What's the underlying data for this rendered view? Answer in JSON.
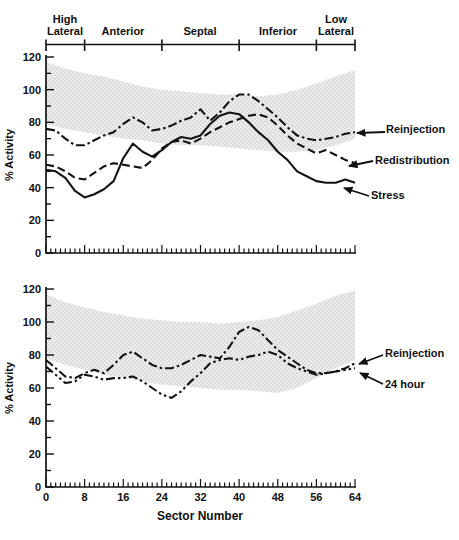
{
  "region_axis": {
    "regions": [
      {
        "label": "High Lateral",
        "from_sector": 0,
        "to_sector": 8
      },
      {
        "label": "Anterior",
        "from_sector": 8,
        "to_sector": 24
      },
      {
        "label": "Septal",
        "from_sector": 24,
        "to_sector": 40
      },
      {
        "label": "Inferior",
        "from_sector": 40,
        "to_sector": 56
      },
      {
        "label": "Low Lateral",
        "from_sector": 56,
        "to_sector": 64
      }
    ],
    "boundaries_sectors": [
      0,
      8,
      24,
      40,
      56,
      64
    ]
  },
  "chart_data": [
    {
      "type": "line",
      "title": "",
      "xlabel": "Sector Number",
      "ylabel": "% Activity",
      "xlim": [
        0,
        64
      ],
      "ylim": [
        0,
        120
      ],
      "x_ticks": [
        0,
        8,
        16,
        24,
        32,
        40,
        48,
        56,
        64
      ],
      "y_ticks": [
        0,
        20,
        40,
        60,
        80,
        100,
        120
      ],
      "x_tick_labels_visible": false,
      "grid": false,
      "legend_position": "right-arrow-annotations",
      "x": [
        0,
        2,
        4,
        6,
        8,
        10,
        12,
        14,
        16,
        18,
        20,
        22,
        24,
        26,
        28,
        30,
        32,
        34,
        36,
        38,
        40,
        42,
        44,
        46,
        48,
        50,
        52,
        54,
        56,
        58,
        60,
        62,
        64
      ],
      "series": [
        {
          "name": "Reinjection",
          "style": "dash-dot",
          "values": [
            76,
            75,
            70,
            66,
            66,
            69,
            72,
            74,
            79,
            83,
            80,
            75,
            76,
            78,
            81,
            83,
            88,
            81,
            86,
            93,
            97,
            97,
            93,
            88,
            83,
            77,
            72,
            70,
            69,
            70,
            71,
            73,
            74
          ]
        },
        {
          "name": "Redistribution",
          "style": "dashed",
          "values": [
            54,
            53,
            50,
            46,
            45,
            49,
            53,
            55,
            54,
            53,
            52,
            57,
            64,
            68,
            69,
            67,
            70,
            74,
            77,
            80,
            82,
            84,
            85,
            83,
            78,
            72,
            67,
            64,
            61,
            63,
            60,
            57,
            55
          ]
        },
        {
          "name": "Stress",
          "style": "solid",
          "values": [
            51,
            50,
            46,
            38,
            34,
            36,
            39,
            44,
            58,
            67,
            62,
            59,
            63,
            68,
            71,
            70,
            72,
            79,
            84,
            86,
            85,
            80,
            74,
            69,
            62,
            57,
            50,
            47,
            44,
            43,
            43,
            45,
            43
          ]
        }
      ],
      "normal_band": {
        "description": "stippled gray normal range band",
        "x": [
          0,
          4,
          8,
          12,
          16,
          20,
          24,
          28,
          32,
          36,
          40,
          44,
          48,
          52,
          56,
          60,
          64
        ],
        "upper": [
          117,
          113,
          110,
          108,
          105,
          102,
          100,
          99,
          98,
          97,
          97,
          96,
          97,
          100,
          104,
          108,
          112
        ],
        "lower": [
          79,
          76,
          74,
          72,
          70,
          69,
          67,
          66,
          66,
          65,
          64,
          63,
          62,
          62,
          63,
          66,
          70
        ]
      },
      "annotations": [
        {
          "label": "Reinjection"
        },
        {
          "label": "Redistribution"
        },
        {
          "label": "Stress"
        }
      ]
    },
    {
      "type": "line",
      "title": "",
      "xlabel": "Sector Number",
      "ylabel": "% Activity",
      "xlim": [
        0,
        64
      ],
      "ylim": [
        0,
        120
      ],
      "x_ticks": [
        0,
        8,
        16,
        24,
        32,
        40,
        48,
        56,
        64
      ],
      "y_ticks": [
        0,
        20,
        40,
        60,
        80,
        100,
        120
      ],
      "x_tick_labels_visible": true,
      "grid": false,
      "legend_position": "right-arrow-annotations",
      "x": [
        0,
        2,
        4,
        6,
        8,
        10,
        12,
        14,
        16,
        18,
        20,
        22,
        24,
        26,
        28,
        30,
        32,
        34,
        36,
        38,
        40,
        42,
        44,
        46,
        48,
        50,
        52,
        54,
        56,
        58,
        60,
        62,
        64
      ],
      "series": [
        {
          "name": "Reinjection",
          "style": "dash-dot",
          "values": [
            77,
            72,
            67,
            66,
            69,
            71,
            69,
            74,
            80,
            82,
            78,
            74,
            72,
            72,
            74,
            77,
            80,
            79,
            78,
            85,
            94,
            97,
            95,
            89,
            83,
            79,
            75,
            71,
            69,
            69,
            70,
            72,
            75
          ]
        },
        {
          "name": "24 hour",
          "style": "dash-dot-dot",
          "values": [
            73,
            68,
            63,
            64,
            68,
            67,
            65,
            66,
            66,
            67,
            64,
            60,
            56,
            54,
            58,
            64,
            69,
            75,
            77,
            78,
            77,
            79,
            80,
            82,
            80,
            75,
            72,
            70,
            68,
            69,
            70,
            71,
            72
          ]
        }
      ],
      "normal_band": {
        "description": "stippled gray normal range band",
        "x": [
          0,
          4,
          8,
          12,
          16,
          20,
          24,
          28,
          32,
          36,
          40,
          44,
          48,
          52,
          56,
          60,
          64
        ],
        "upper": [
          117,
          112,
          109,
          106,
          104,
          102,
          101,
          100,
          100,
          99,
          100,
          101,
          103,
          107,
          111,
          116,
          119
        ],
        "lower": [
          78,
          74,
          71,
          68,
          66,
          64,
          62,
          61,
          60,
          59,
          59,
          58,
          57,
          60,
          66,
          72,
          77
        ]
      },
      "annotations": [
        {
          "label": "Reinjection"
        },
        {
          "label": "24 hour"
        }
      ]
    }
  ],
  "colors": {
    "line": "#131313",
    "text": "#111111",
    "band_dot": "#c3c3c3",
    "band_bg": "#ececec"
  }
}
